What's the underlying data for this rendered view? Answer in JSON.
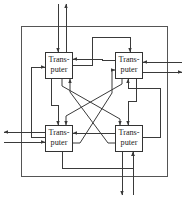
{
  "figure": {
    "background_color": "#ffffff",
    "line_color": "#3a3a3a",
    "frame_color": "#555555",
    "box_fill": "#ffffff",
    "box_stroke": "#333333",
    "text_color": "#1a1a1a"
  },
  "nodes": [
    {
      "id": "transputer-top-left",
      "label_line1": "Trans-",
      "label_line2": "puter",
      "x": 45,
      "y": 52,
      "w": 28,
      "h": 27
    },
    {
      "id": "transputer-top-right",
      "label_line1": "Trans-",
      "label_line2": "puter",
      "x": 115,
      "y": 52,
      "w": 28,
      "h": 27
    },
    {
      "id": "transputer-bottom-left",
      "label_line1": "Trans-",
      "label_line2": "puter",
      "x": 45,
      "y": 125,
      "w": 28,
      "h": 27
    },
    {
      "id": "transputer-bottom-right",
      "label_line1": "Trans-",
      "label_line2": "puter",
      "x": 115,
      "y": 125,
      "w": 28,
      "h": 27
    }
  ],
  "frame": {
    "x": 21,
    "y": 26,
    "w": 147,
    "h": 151
  },
  "external_links": [
    {
      "id": "top-in",
      "side": "top",
      "direction": "in"
    },
    {
      "id": "top-out",
      "side": "top",
      "direction": "out"
    },
    {
      "id": "right-in",
      "side": "right",
      "direction": "in"
    },
    {
      "id": "right-out",
      "side": "right",
      "direction": "out"
    },
    {
      "id": "left-out",
      "side": "left",
      "direction": "out"
    },
    {
      "id": "left-in",
      "side": "left",
      "direction": "in"
    },
    {
      "id": "bottom-out",
      "side": "bottom",
      "direction": "out"
    },
    {
      "id": "bottom-in",
      "side": "bottom",
      "direction": "in"
    }
  ],
  "internal_links": [
    {
      "id": "link-tl-tr",
      "from": "transputer-top-left",
      "to": "transputer-top-right"
    },
    {
      "id": "link-tr-tl",
      "from": "transputer-top-right",
      "to": "transputer-top-left"
    },
    {
      "id": "link-tl-bl",
      "from": "transputer-top-left",
      "to": "transputer-bottom-left"
    },
    {
      "id": "link-bl-tl",
      "from": "transputer-bottom-left",
      "to": "transputer-top-left"
    },
    {
      "id": "link-tr-br",
      "from": "transputer-top-right",
      "to": "transputer-bottom-right"
    },
    {
      "id": "link-br-tr",
      "from": "transputer-bottom-right",
      "to": "transputer-top-right"
    },
    {
      "id": "link-bl-br",
      "from": "transputer-bottom-left",
      "to": "transputer-bottom-right"
    },
    {
      "id": "link-br-bl",
      "from": "transputer-bottom-right",
      "to": "transputer-bottom-left"
    },
    {
      "id": "link-tl-br",
      "from": "transputer-top-left",
      "to": "transputer-bottom-right"
    },
    {
      "id": "link-br-tl",
      "from": "transputer-bottom-right",
      "to": "transputer-top-left"
    },
    {
      "id": "link-tr-bl",
      "from": "transputer-top-right",
      "to": "transputer-bottom-left"
    },
    {
      "id": "link-bl-tr",
      "from": "transputer-bottom-left",
      "to": "transputer-top-right"
    }
  ]
}
